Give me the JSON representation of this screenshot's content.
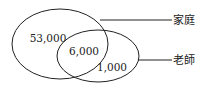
{
  "diagram": {
    "type": "venn",
    "sets": [
      {
        "label": "家庭",
        "only_value": "53,000"
      },
      {
        "label": "老師",
        "only_value": "1,000"
      }
    ],
    "intersection_value": "6,000",
    "colors": {
      "stroke": "#222222",
      "background": "#ffffff"
    }
  }
}
